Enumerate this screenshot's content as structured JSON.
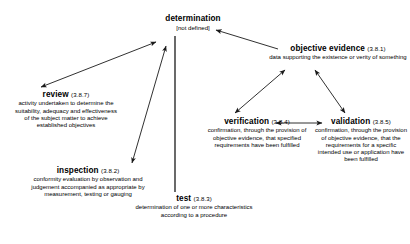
{
  "diagram": {
    "line_color": "#1a1a1a",
    "text_color": "#000000",
    "background": "#ffffff"
  },
  "nodes": {
    "determination": {
      "term": "determination",
      "ref": "",
      "definition": "[not defined]"
    },
    "objective_evidence": {
      "term": "objective evidence",
      "ref": "(3.8.1)",
      "definition": "data supporting the existence or verity of something"
    },
    "review": {
      "term": "review",
      "ref": "(3.8.7)",
      "definition": "activity undertaken to determine the suitability, adequacy and effectiveness of the subject matter to achieve established objectives"
    },
    "inspection": {
      "term": "inspection",
      "ref": "(3.8.2)",
      "definition": "conformity evaluation by observation and judgement accompanied as appropriate by measurement, testing or gauging"
    },
    "test": {
      "term": "test",
      "ref": "(3.8.3)",
      "definition": "determination of one or more characteristics according to a  procedure"
    },
    "verification": {
      "term": "verification",
      "ref": "(3.8.4)",
      "definition": "confirmation, through the provision of objective evidence, that specified requirements have been fulfilled"
    },
    "validation": {
      "term": "validation",
      "ref": "(3.8.5)",
      "definition": "confirmation,  through the provision of objective evidence, that the requirements for a specific intended use or application have been fulfilled"
    }
  },
  "connections": [
    {
      "name": "review-determination",
      "from": "review",
      "to": "determination",
      "style": "double-arrow"
    },
    {
      "name": "inspection-determination",
      "from": "inspection",
      "to": "determination",
      "style": "double-arrow"
    },
    {
      "name": "determination-test",
      "from": "determination",
      "to": "test",
      "style": "plain-line"
    },
    {
      "name": "objective-evidence-determination",
      "from": "objective evidence",
      "to": "determination",
      "style": "single-arrow"
    },
    {
      "name": "verification-objective-evidence",
      "from": "verification",
      "to": "objective evidence",
      "style": "double-arrow"
    },
    {
      "name": "validation-objective-evidence",
      "from": "validation",
      "to": "objective evidence",
      "style": "double-arrow"
    },
    {
      "name": "verification-validation",
      "from": "verification",
      "to": "validation",
      "style": "double-arrow"
    }
  ]
}
